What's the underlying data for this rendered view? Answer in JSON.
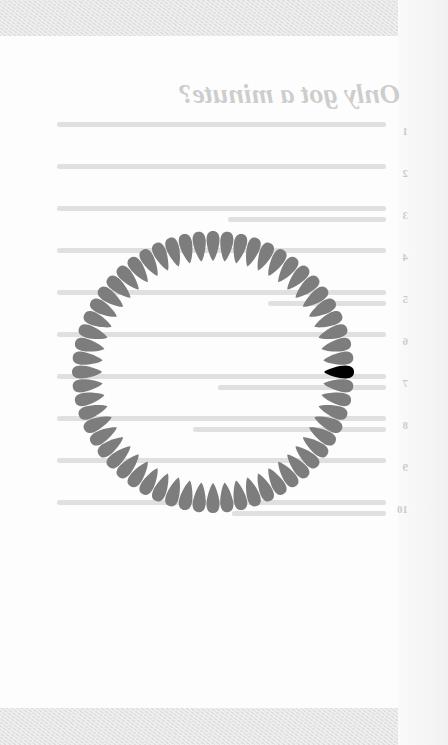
{
  "background_page": {
    "title": "Only got a minute?",
    "mirrored": true,
    "list_items": [
      {
        "number": "1",
        "lines": 1
      },
      {
        "number": "2",
        "lines": 1
      },
      {
        "number": "3",
        "lines": 2
      },
      {
        "number": "4",
        "lines": 1
      },
      {
        "number": "5",
        "lines": 2
      },
      {
        "number": "6",
        "lines": 1
      },
      {
        "number": "7",
        "lines": 2
      },
      {
        "number": "8",
        "lines": 2
      },
      {
        "number": "9",
        "lines": 1
      },
      {
        "number": "10",
        "lines": 2
      }
    ]
  },
  "spinner": {
    "petal_count": 60,
    "active_index": 15,
    "petal_color": "#7d7d7d",
    "active_color": "#000000"
  },
  "colors": {
    "background": "#fdfdfd",
    "band": "#e2e2e2"
  }
}
